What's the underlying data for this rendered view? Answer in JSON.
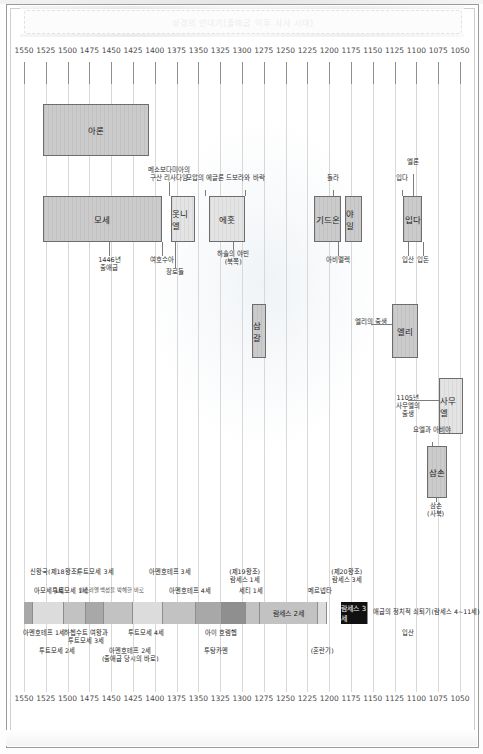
{
  "document": {
    "header_title": "성경의 연대기(출애굽 이후 사사 시대)",
    "frame_label": "chronology-chart"
  },
  "chart_data": {
    "type": "table",
    "title": "성경의 연대기(출애굽 이후 사사 시대)",
    "xlabel": "",
    "ylabel": "",
    "axis_direction": "descending",
    "xlim": [
      1550,
      1050
    ],
    "grid": true,
    "legend": "none",
    "tick_labels": [
      "1550",
      "1525",
      "1500",
      "1475",
      "1450",
      "1425",
      "1400",
      "1375",
      "1350",
      "1325",
      "1300",
      "1275",
      "1250",
      "1225",
      "1200",
      "1175",
      "1150",
      "1125",
      "1100",
      "1075",
      "1050"
    ],
    "top_axis": [
      "1550",
      "1525",
      "1500",
      "1475",
      "1450",
      "1425",
      "1400",
      "1375",
      "1350",
      "1325",
      "1300",
      "1275",
      "1250",
      "1225",
      "1200",
      "1175",
      "1150",
      "1125",
      "1100",
      "1075",
      "1050"
    ],
    "bottom_axis": [
      "1550",
      "1525",
      "1500",
      "1475",
      "1450",
      "1425",
      "1400",
      "1375",
      "1350",
      "1325",
      "1300",
      "1275",
      "1250",
      "1225",
      "1200",
      "1175",
      "1150",
      "1125",
      "1100",
      "1075",
      "1050"
    ],
    "bars": [
      {
        "name": "아론",
        "start": 1528,
        "end": 1407,
        "row": 1,
        "shade": "mid"
      },
      {
        "name": "모세",
        "start": 1528,
        "end": 1392,
        "row": 2,
        "shade": "mid"
      },
      {
        "name": "옷니엘",
        "start": 1381,
        "end": 1354,
        "row": 2,
        "shade": "light"
      },
      {
        "name": "에훗",
        "start": 1338,
        "end": 1297,
        "row": 2,
        "shade": "light"
      },
      {
        "name": "기드온",
        "start": 1217,
        "end": 1186,
        "row": 2,
        "shade": "mid"
      },
      {
        "name": "야일",
        "start": 1182,
        "end": 1162,
        "row": 2,
        "shade": "mid"
      },
      {
        "name": "입다",
        "start": 1115,
        "end": 1093,
        "row": 2,
        "shade": "mid"
      },
      {
        "name": "삼갈",
        "start": 1289,
        "end": 1273,
        "row": 3,
        "shade": "mid"
      },
      {
        "name": "엘리",
        "start": 1128,
        "end": 1098,
        "row": 3,
        "shade": "mid"
      },
      {
        "name": "사무엘",
        "start": 1074,
        "end": 1046,
        "row": 4,
        "shade": "light"
      },
      {
        "name": "삼손",
        "start": 1088,
        "end": 1065,
        "row": 5,
        "shade": "mid"
      }
    ],
    "annotations": [
      {
        "text": "메소보다미아의\n구산 리사다임",
        "x": 1384
      },
      {
        "text": "모압의 에글론",
        "x": 1342
      },
      {
        "text": "드보라와 바락",
        "x": 1296
      },
      {
        "text": "돌라",
        "x": 1196
      },
      {
        "text": "엘론",
        "x": 1104
      },
      {
        "text": "입다",
        "x": 1117
      },
      {
        "text": "1446년\n출애굽",
        "x": 1452
      },
      {
        "text": "여호수아",
        "x": 1392
      },
      {
        "text": "장로들",
        "x": 1377
      },
      {
        "text": "하솔의 야빈\n(북쪽)",
        "x": 1310
      },
      {
        "text": "아비멜렉",
        "x": 1190
      },
      {
        "text": "입산",
        "x": 1110
      },
      {
        "text": "입돈",
        "x": 1092
      },
      {
        "text": "엘리의 출생",
        "x": 1152
      },
      {
        "text": "1105년\n사무엘의\n출생",
        "x": 1110
      },
      {
        "text": "요엘과 아비야",
        "x": 1082
      },
      {
        "text": "삼손\n(사북)",
        "x": 1078
      }
    ]
  },
  "egypt_timeline": {
    "title_note": "애굽 왕조 연대",
    "segments": [
      {
        "label": "",
        "start": 1550,
        "end": 1540,
        "shade": "dark"
      },
      {
        "label": "",
        "start": 1540,
        "end": 1504,
        "shade": "light"
      },
      {
        "label": "",
        "start": 1504,
        "end": 1479,
        "shade": "mid"
      },
      {
        "label": "",
        "start": 1479,
        "end": 1458,
        "shade": "dark"
      },
      {
        "label": "",
        "start": 1458,
        "end": 1425,
        "shade": "mid"
      },
      {
        "label": "",
        "start": 1425,
        "end": 1391,
        "shade": "light"
      },
      {
        "label": "",
        "start": 1391,
        "end": 1353,
        "shade": "mid"
      },
      {
        "label": "",
        "start": 1353,
        "end": 1323,
        "shade": "dark"
      },
      {
        "label": "",
        "start": 1323,
        "end": 1295,
        "shade": "darker"
      },
      {
        "label": "",
        "start": 1295,
        "end": 1279,
        "shade": "mid"
      },
      {
        "label": "람세스 2세",
        "start": 1279,
        "end": 1213,
        "shade": "mid"
      },
      {
        "label": "",
        "start": 1213,
        "end": 1203,
        "shade": "light"
      },
      {
        "label": "람세스 3세",
        "start": 1186,
        "end": 1155,
        "shade": "black"
      }
    ],
    "labels_above": [
      {
        "text": "신왕국(제18왕조)",
        "x": 1543,
        "align": "left"
      },
      {
        "text": "투트모세 3세",
        "x": 1468
      },
      {
        "text": "아멘호테프 3세",
        "x": 1383
      },
      {
        "text": "(제19왕조)\n람세스 1세",
        "x": 1297
      },
      {
        "text": "(제20왕조)\n람세스 3세",
        "x": 1180
      }
    ],
    "labels_row2": [
      {
        "text": "아모세 1세",
        "x": 1538,
        "align": "left"
      },
      {
        "text": "투트모세 1세",
        "x": 1497
      },
      {
        "text": "이스라엘 백성을 박해한 바로",
        "x": 1450,
        "tiny": true
      },
      {
        "text": "아멘호테프 4세",
        "x": 1360
      },
      {
        "text": "세티 1세",
        "x": 1290
      },
      {
        "text": "메르넵타",
        "x": 1210
      }
    ],
    "labels_below": [
      {
        "text": "아멘호테프 1세",
        "x": 1527
      },
      {
        "text": "하쳅수트 여왕과\n투트모세 3세",
        "x": 1479
      },
      {
        "text": "투트모세 4세",
        "x": 1410
      },
      {
        "text": "아이 호렘헵",
        "x": 1324
      },
      {
        "text": "입산",
        "x": 1110
      }
    ],
    "labels_below2": [
      {
        "text": "투트모세 2세",
        "x": 1512
      },
      {
        "text": "아멘호테프 2세\n(출애굽 당시의 바로)",
        "x": 1428
      },
      {
        "text": "투탕카멘",
        "x": 1330
      },
      {
        "text": "(혼란기)",
        "x": 1208
      }
    ],
    "trailing_note": "애굽의 정치적 쇠퇴기(람세스 4~11세)"
  },
  "colors": {
    "bar_fill_light": "#e4e4e4",
    "bar_fill_mid": "#cbcbcb",
    "bar_fill_dark": "#b2b2b2",
    "bar_border": "#6d6d6d",
    "grid": "#d8d8d8",
    "text": "#2a2a2a",
    "black_segment": "#111111"
  }
}
